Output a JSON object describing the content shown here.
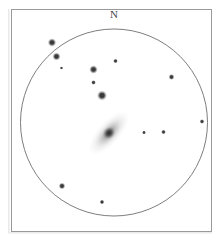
{
  "figure": {
    "kind": "astronomical-eyepiece-sketch",
    "background_color": "#ffffff",
    "frame_color": "#9a9a9a",
    "ink_color": "#3a3a3a"
  },
  "labels": {
    "north": "N"
  },
  "field_of_view": {
    "center_x": 114,
    "center_y": 122.5,
    "radius": 93.5,
    "stroke_color": "#6e6e6e",
    "stroke_width": 0.9,
    "fill_color": "#ffffff"
  },
  "chart_data": {
    "type": "scatter",
    "title": "N",
    "xlabel": "",
    "ylabel": "",
    "grid": false,
    "legend": null,
    "xlim": [
      20.5,
      207.5
    ],
    "ylim": [
      29,
      216
    ],
    "annotations": [
      {
        "text": "N",
        "x": 114,
        "y": 14,
        "role": "compass-north"
      }
    ],
    "series": [
      {
        "name": "stars",
        "marker": "filled-circle",
        "color": "#3a3a3a",
        "points": [
          {
            "x": 52.0,
            "y": 42.5,
            "size": 4.6,
            "magnitude_rank": 2
          },
          {
            "x": 56.5,
            "y": 56.5,
            "size": 4.4,
            "magnitude_rank": 2
          },
          {
            "x": 61.5,
            "y": 68.0,
            "size": 1.8,
            "magnitude_rank": 5
          },
          {
            "x": 93.5,
            "y": 69.5,
            "size": 4.6,
            "magnitude_rank": 2
          },
          {
            "x": 115.5,
            "y": 61.0,
            "size": 2.6,
            "magnitude_rank": 4
          },
          {
            "x": 171.5,
            "y": 77.0,
            "size": 3.2,
            "magnitude_rank": 3
          },
          {
            "x": 93.5,
            "y": 82.5,
            "size": 2.6,
            "magnitude_rank": 4
          },
          {
            "x": 102.0,
            "y": 95.5,
            "size": 5.4,
            "magnitude_rank": 1
          },
          {
            "x": 144.0,
            "y": 132.5,
            "size": 2.2,
            "magnitude_rank": 4
          },
          {
            "x": 163.5,
            "y": 132.0,
            "size": 2.6,
            "magnitude_rank": 4
          },
          {
            "x": 202.0,
            "y": 121.5,
            "size": 2.6,
            "magnitude_rank": 4
          },
          {
            "x": 62.0,
            "y": 186.0,
            "size": 3.6,
            "magnitude_rank": 3
          },
          {
            "x": 102.0,
            "y": 202.0,
            "size": 2.6,
            "magnitude_rank": 4
          }
        ]
      },
      {
        "name": "galaxy",
        "marker": "diffuse-ellipse",
        "color": "#4a4a4a",
        "points": [
          {
            "x": 109.0,
            "y": 133.0,
            "core_rx": 7.0,
            "core_ry": 6.0,
            "halo_rx": 28.0,
            "halo_ry": 11.5,
            "position_angle_deg": 132
          }
        ]
      }
    ]
  }
}
